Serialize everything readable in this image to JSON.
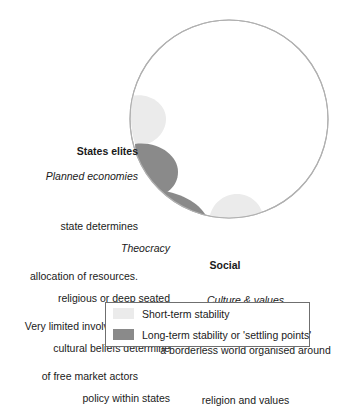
{
  "figure": {
    "type": "conceptual-diagram",
    "shape": "circle-with-settling-point-blobs",
    "colors": {
      "circle_stroke": "#b0b0b0",
      "circle_fill": "#ffffff",
      "short_term": "#ebebeb",
      "long_term": "#8a8a8a",
      "legend_border": "#6f6f6f",
      "text": "#1a1a1a"
    },
    "circle": {
      "cx": 229,
      "cy": 119,
      "r": 99
    },
    "blobs": [
      {
        "name": "states-elites-blob",
        "stability": "short-term",
        "color": "#ebebeb"
      },
      {
        "name": "planned-economies-blob",
        "stability": "long-term",
        "color": "#8a8a8a"
      },
      {
        "name": "theocracy-blob",
        "stability": "long-term",
        "color": "#8a8a8a"
      },
      {
        "name": "social-movements-blob",
        "stability": "short-term",
        "color": "#ebebeb"
      }
    ]
  },
  "labels": {
    "states_elites": {
      "heading": "States elites"
    },
    "planned_economies": {
      "heading": "Planned economies",
      "line1": "state determines",
      "line2": "allocation of resources.",
      "line3": "Very limited involvement",
      "line4": "of free market actors"
    },
    "theocracy": {
      "heading": "Theocracy",
      "line1": "religious or deep seated",
      "line2": "cultural beliefs determine",
      "line3": "policy within states"
    },
    "social_movements": {
      "heading_line1": "Social",
      "heading_line2": "movements"
    },
    "culture_values": {
      "heading": "Culture & values",
      "line1": "a borderless world organised around",
      "line2": "religion and values"
    }
  },
  "legend": {
    "items": [
      {
        "swatch": "short-term-swatch",
        "label": "Short-term stability"
      },
      {
        "swatch": "long-term-swatch",
        "label": "Long-term stability or 'settling points'"
      }
    ]
  }
}
